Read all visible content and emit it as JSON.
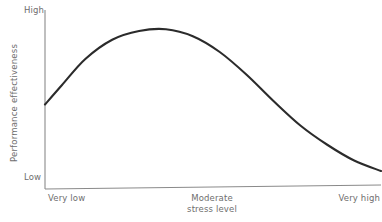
{
  "chart_data": {
    "type": "line",
    "title": "",
    "subtitle": "",
    "xlabel": "stress level",
    "ylabel": "Performance effectiveness",
    "grid": false,
    "legend": false,
    "legend_position": "none",
    "axis": {
      "x_tick_labels": [
        "Very low",
        "Moderate",
        "Very high"
      ],
      "y_tick_labels": [
        "High",
        "Low"
      ],
      "xlim": [
        0,
        100
      ],
      "ylim": [
        0,
        100
      ]
    },
    "series": [
      {
        "name": "Performance effectiveness vs stress level",
        "color": "#2b2b2b",
        "x": [
          0,
          5,
          12,
          20,
          28,
          36,
          44,
          52,
          60,
          68,
          76,
          84,
          92,
          100
        ],
        "y": [
          46,
          57,
          72,
          83,
          88,
          89,
          85,
          76,
          63,
          48,
          34,
          23,
          14,
          8
        ]
      }
    ],
    "annotations": [
      {
        "text": "High",
        "position": "y-axis-top"
      },
      {
        "text": "Low",
        "position": "y-axis-bottom"
      },
      {
        "text": "Very low",
        "position": "x-axis-left"
      },
      {
        "text": "Moderate",
        "position": "x-axis-center"
      },
      {
        "text": "stress level",
        "position": "x-axis-center-second-line"
      },
      {
        "text": "Very high",
        "position": "x-axis-right"
      }
    ]
  },
  "labels": {
    "y_high": "High",
    "y_low": "Low",
    "y_axis_title": "Performance effectiveness",
    "x_very_low": "Very low",
    "x_moderate": "Moderate",
    "x_stress_level": "stress level",
    "x_very_high": "Very high"
  },
  "colors": {
    "curve": "#2b2b2b",
    "axis": "#8a8a8a",
    "text": "#6e6e6e",
    "background": "#ffffff"
  }
}
